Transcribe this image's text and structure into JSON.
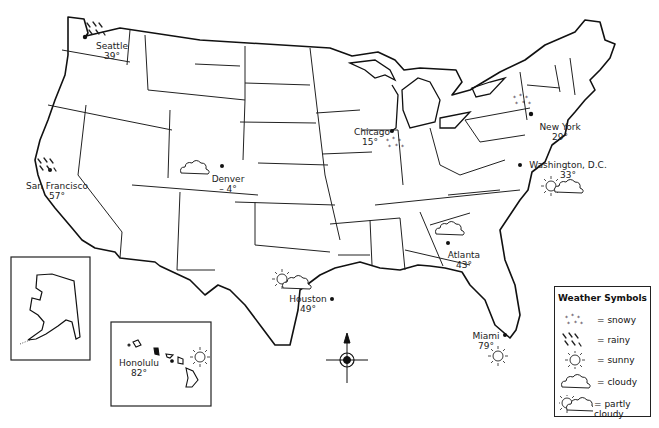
{
  "map": {
    "type": "US weather map",
    "compass": "compass-rose north arrow",
    "insets": [
      "Alaska",
      "Hawaii"
    ]
  },
  "cities": [
    {
      "name": "Seattle",
      "temp": "39°",
      "weather": "rainy"
    },
    {
      "name": "San Francisco",
      "temp": "57°",
      "weather": "rainy"
    },
    {
      "name": "Denver",
      "temp": "– 4°",
      "weather": "cloudy"
    },
    {
      "name": "Chicago",
      "temp": "15°",
      "weather": "snowy"
    },
    {
      "name": "New York",
      "temp": "29°",
      "weather": "snowy"
    },
    {
      "name": "Washington, D.C.",
      "temp": "33°",
      "weather": "partly cloudy"
    },
    {
      "name": "Atlanta",
      "temp": "43°",
      "weather": "cloudy"
    },
    {
      "name": "Houston",
      "temp": "49°",
      "weather": "partly cloudy"
    },
    {
      "name": "Miami",
      "temp": "79°",
      "weather": "sunny"
    },
    {
      "name": "Honolulu",
      "temp": "82°",
      "weather": "sunny"
    }
  ],
  "legend": {
    "title": "Weather Symbols",
    "items": [
      {
        "symbol": "snowy-icon",
        "label": "= snowy"
      },
      {
        "symbol": "rainy-icon",
        "label": "= rainy"
      },
      {
        "symbol": "sunny-icon",
        "label": "= sunny"
      },
      {
        "symbol": "cloudy-icon",
        "label": "= cloudy"
      },
      {
        "symbol": "partly-cloudy-icon",
        "label": "= partly cloudy"
      }
    ]
  }
}
